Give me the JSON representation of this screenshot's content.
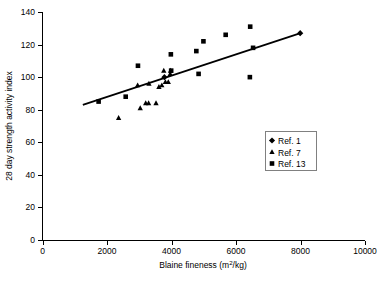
{
  "chart_data": {
    "type": "scatter",
    "title": "",
    "xlabel": "Blaine fineness (m2/kg)",
    "xlabel_parts": {
      "pre": "Blaine fineness (m",
      "sup": "2",
      "post": "/kg)"
    },
    "ylabel": "28 day strength activity index",
    "xlim": [
      0,
      10000
    ],
    "ylim": [
      0,
      140
    ],
    "xticks": [
      0,
      2000,
      4000,
      6000,
      8000,
      10000
    ],
    "yticks": [
      0,
      20,
      40,
      60,
      80,
      100,
      120,
      140
    ],
    "xtick_labels": [
      "0",
      "2000",
      "4000",
      "6000",
      "8000",
      "10000"
    ],
    "ytick_labels": [
      "0",
      "20",
      "40",
      "60",
      "80",
      "100",
      "120",
      "140"
    ],
    "grid": false,
    "legend_position": "center-right",
    "series": [
      {
        "name": "Ref. 1",
        "marker": "diamond",
        "color": "#000000",
        "points": [
          {
            "x": 3780,
            "y": 100
          },
          {
            "x": 7990,
            "y": 127
          }
        ]
      },
      {
        "name": "Ref. 7",
        "marker": "triangle",
        "color": "#000000",
        "points": [
          {
            "x": 2360,
            "y": 75
          },
          {
            "x": 2950,
            "y": 95
          },
          {
            "x": 3030,
            "y": 81
          },
          {
            "x": 3200,
            "y": 84
          },
          {
            "x": 3290,
            "y": 84
          },
          {
            "x": 3300,
            "y": 96
          },
          {
            "x": 3520,
            "y": 84
          },
          {
            "x": 3610,
            "y": 94
          },
          {
            "x": 3700,
            "y": 95
          },
          {
            "x": 3760,
            "y": 104
          },
          {
            "x": 3810,
            "y": 97
          },
          {
            "x": 3900,
            "y": 97
          },
          {
            "x": 3960,
            "y": 102
          },
          {
            "x": 3970,
            "y": 104
          }
        ]
      },
      {
        "name": "Ref. 13",
        "marker": "square",
        "color": "#000000",
        "points": [
          {
            "x": 1740,
            "y": 85
          },
          {
            "x": 2580,
            "y": 88
          },
          {
            "x": 2960,
            "y": 107
          },
          {
            "x": 3980,
            "y": 114
          },
          {
            "x": 3990,
            "y": 104
          },
          {
            "x": 4770,
            "y": 116
          },
          {
            "x": 4840,
            "y": 102
          },
          {
            "x": 4990,
            "y": 122
          },
          {
            "x": 5680,
            "y": 126
          },
          {
            "x": 6440,
            "y": 131
          },
          {
            "x": 6430,
            "y": 100
          },
          {
            "x": 6530,
            "y": 118
          }
        ]
      }
    ],
    "trend_line": {
      "name": "trend-line",
      "x0": 1250,
      "y0": 83,
      "x1": 8000,
      "y1": 127
    }
  },
  "legend": {
    "entries": [
      {
        "label": "Ref. 1",
        "marker": "diamond"
      },
      {
        "label": "Ref. 7",
        "marker": "triangle"
      },
      {
        "label": "Ref. 13",
        "marker": "square"
      }
    ]
  }
}
